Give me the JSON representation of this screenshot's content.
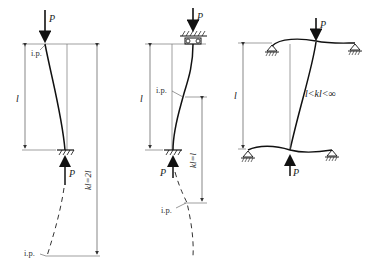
{
  "figure": {
    "diagrams": [
      {
        "id": "left",
        "load_label": "P",
        "length_label": "l",
        "inflection_label": "i.p.",
        "effective_length_label": "kl=2l",
        "case": "fixed base, free top"
      },
      {
        "id": "middle",
        "load_label": "P",
        "length_label": "l",
        "inflection_label": "i.p.",
        "effective_length_label": "kl=l",
        "case": "fixed base, guided top"
      },
      {
        "id": "right",
        "load_label": "P",
        "length_label": "l",
        "effective_length_label": "l<kl<∞",
        "case": "column in frame with pinned beams"
      }
    ]
  },
  "colors": {
    "line": "#222222",
    "thin": "#666666",
    "background": "#ffffff"
  }
}
